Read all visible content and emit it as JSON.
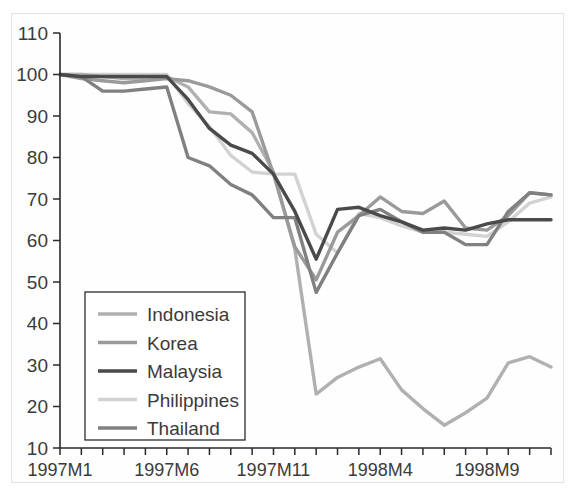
{
  "figure": {
    "background_color": "#ffffff",
    "frame_color": "#e2e2e2",
    "axis_color": "#2b2b2b"
  },
  "chart_data": {
    "type": "line",
    "title": "",
    "subtitle": "",
    "xlabel": "",
    "ylabel": "",
    "grid": false,
    "legend_position": "lower-left",
    "ylim": [
      10,
      110
    ],
    "ytick_labels": [
      "110",
      "100",
      "90",
      "80",
      "70",
      "60",
      "50",
      "40",
      "30",
      "20",
      "10"
    ],
    "ytick_values": [
      110,
      100,
      90,
      80,
      70,
      60,
      50,
      40,
      30,
      20,
      10
    ],
    "x": [
      "1997M1",
      "1997M2",
      "1997M3",
      "1997M4",
      "1997M5",
      "1997M6",
      "1997M7",
      "1997M8",
      "1997M9",
      "1997M10",
      "1997M11",
      "1997M12",
      "1998M1",
      "1998M2",
      "1998M3",
      "1998M4",
      "1998M5",
      "1998M6",
      "1998M7",
      "1998M8",
      "1998M9",
      "1998M10",
      "1998M11",
      "1998M12"
    ],
    "xtick_labels": [
      "1997M1",
      "1997M6",
      "1997M11",
      "1998M4",
      "1998M9"
    ],
    "xtick_indices": [
      0,
      5,
      10,
      15,
      20
    ],
    "series": [
      {
        "name": "Indonesia",
        "color": "#b0b0b0",
        "values": [
          100,
          100,
          99.5,
          99,
          99,
          99.5,
          97,
          91,
          90.5,
          86,
          76.5,
          58,
          23,
          27,
          29.5,
          31.5,
          24,
          19.5,
          15.5,
          18.5,
          22,
          30.5,
          32,
          29.5
        ]
      },
      {
        "name": "Korea",
        "color": "#9a9a9a",
        "values": [
          100,
          99,
          98.5,
          98,
          98.5,
          99,
          98.5,
          97,
          95,
          91,
          76,
          58.5,
          50.5,
          62,
          66,
          70.5,
          67,
          66.5,
          69.5,
          63,
          62.5,
          66,
          71.5,
          71
        ]
      },
      {
        "name": "Malaysia",
        "color": "#4a4a4a",
        "values": [
          100,
          99.5,
          99.5,
          99.5,
          99.5,
          99.5,
          94,
          87,
          83,
          81,
          76,
          67,
          55.5,
          67.5,
          68,
          66,
          64.5,
          62.5,
          63,
          62.5,
          64,
          65,
          65,
          65
        ]
      },
      {
        "name": "Philippines",
        "color": "#d2d2d2",
        "values": [
          100,
          100,
          100,
          100,
          100,
          100,
          93,
          87.5,
          80.5,
          76.5,
          76,
          76,
          61.5,
          57,
          66.5,
          65.5,
          63.5,
          62,
          62,
          61.5,
          61,
          64.5,
          69,
          70.5
        ]
      },
      {
        "name": "Thailand",
        "color": "#808080",
        "values": [
          100,
          99.5,
          96,
          96,
          96.5,
          97,
          80,
          78,
          73.5,
          71,
          65.5,
          65.5,
          47.5,
          57,
          66,
          67.5,
          64.5,
          62,
          62,
          59,
          59,
          67,
          71.5,
          71
        ]
      }
    ]
  },
  "legend": {
    "items": [
      {
        "label": "Indonesia"
      },
      {
        "label": "Korea"
      },
      {
        "label": "Malaysia"
      },
      {
        "label": "Philippines"
      },
      {
        "label": "Thailand"
      }
    ]
  }
}
